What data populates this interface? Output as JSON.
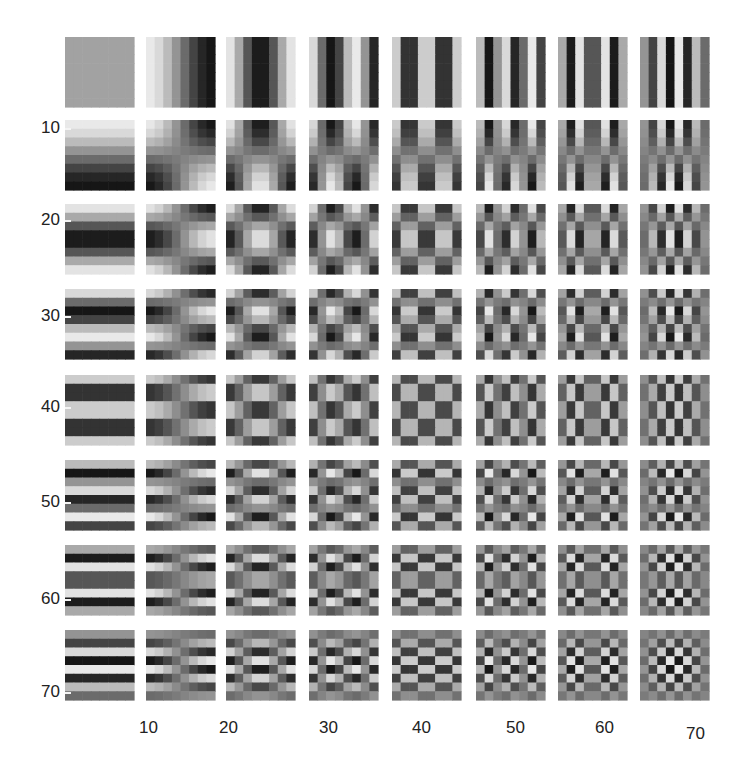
{
  "chart_data": {
    "type": "heatmap",
    "title": "",
    "xlabel": "",
    "ylabel": "",
    "grid_size": [
      8,
      8
    ],
    "tile_size": [
      8,
      8
    ],
    "x_ticks": [
      10,
      20,
      30,
      40,
      50,
      60,
      70
    ],
    "y_ticks": [
      10,
      20,
      30,
      40,
      50,
      60,
      70
    ],
    "xlim": [
      0.5,
      72.5
    ],
    "ylim": [
      72.5,
      0.5
    ],
    "colormap": "gray",
    "grid": false,
    "legend": null,
    "basis": "cos((2x+1)u*pi/16) * cos((2y+1)v*pi/16), u=column index 0..7, v=row index 0..7"
  },
  "axes": {
    "x_tick_labels": [
      "10",
      "20",
      "30",
      "40",
      "50",
      "60",
      "70"
    ],
    "y_tick_labels": [
      "10",
      "20",
      "30",
      "40",
      "50",
      "60",
      "70"
    ]
  }
}
